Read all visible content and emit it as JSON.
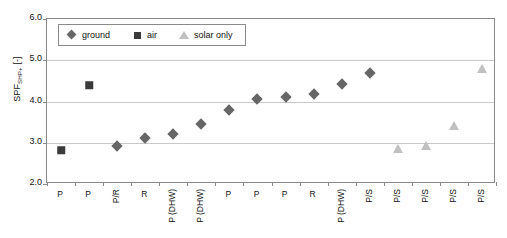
{
  "chart_data": {
    "type": "scatter",
    "title": "",
    "xlabel": "",
    "ylabel": "SPF",
    "ylabel_subscript": "SHP+",
    "ylabel_units": "[-]",
    "ylabel_full": "SPF_SHP+ [-]",
    "ylim": [
      2.0,
      6.0
    ],
    "ytick_labels": [
      "6.0",
      "5.0",
      "4.0",
      "3.0",
      "2.0"
    ],
    "ytick_values": [
      6.0,
      5.0,
      4.0,
      3.0,
      2.0
    ],
    "grid": true,
    "legend_position": "top-left-inside",
    "categories": [
      "P",
      "P",
      "P/R",
      "R",
      "P (DHW)",
      "P (DHW)",
      "P",
      "P",
      "P",
      "R",
      "P (DHW)",
      "P/S",
      "P/S",
      "P/S",
      "P/S",
      "P/S"
    ],
    "series": [
      {
        "name": "ground",
        "marker": "diamond",
        "color": "#666666",
        "points": [
          {
            "index": 2,
            "category": "P/R",
            "value": 2.93
          },
          {
            "index": 3,
            "category": "R",
            "value": 3.12
          },
          {
            "index": 4,
            "category": "P (DHW)",
            "value": 3.22
          },
          {
            "index": 5,
            "category": "P (DHW)",
            "value": 3.46
          },
          {
            "index": 6,
            "category": "P",
            "value": 3.8
          },
          {
            "index": 7,
            "category": "P",
            "value": 4.07
          },
          {
            "index": 8,
            "category": "P",
            "value": 4.1
          },
          {
            "index": 9,
            "category": "R",
            "value": 4.19
          },
          {
            "index": 10,
            "category": "P (DHW)",
            "value": 4.42
          },
          {
            "index": 11,
            "category": "P/S",
            "value": 4.68
          }
        ]
      },
      {
        "name": "air",
        "marker": "square",
        "color": "#3a3a3a",
        "points": [
          {
            "index": 0,
            "category": "P",
            "value": 2.82
          },
          {
            "index": 1,
            "category": "P",
            "value": 4.4
          }
        ]
      },
      {
        "name": "solar only",
        "marker": "triangle",
        "color": "#c0c0c0",
        "points": [
          {
            "index": 12,
            "category": "P/S",
            "value": 2.86
          },
          {
            "index": 13,
            "category": "P/S",
            "value": 2.91
          },
          {
            "index": 14,
            "category": "P/S",
            "value": 3.41
          },
          {
            "index": 15,
            "category": "P/S",
            "value": 4.8
          }
        ]
      }
    ],
    "legend": [
      {
        "label": "ground",
        "marker": "diamond",
        "color": "#666666"
      },
      {
        "label": "air",
        "marker": "square",
        "color": "#3a3a3a"
      },
      {
        "label": "solar only",
        "marker": "triangle",
        "color": "#c0c0c0"
      }
    ]
  }
}
